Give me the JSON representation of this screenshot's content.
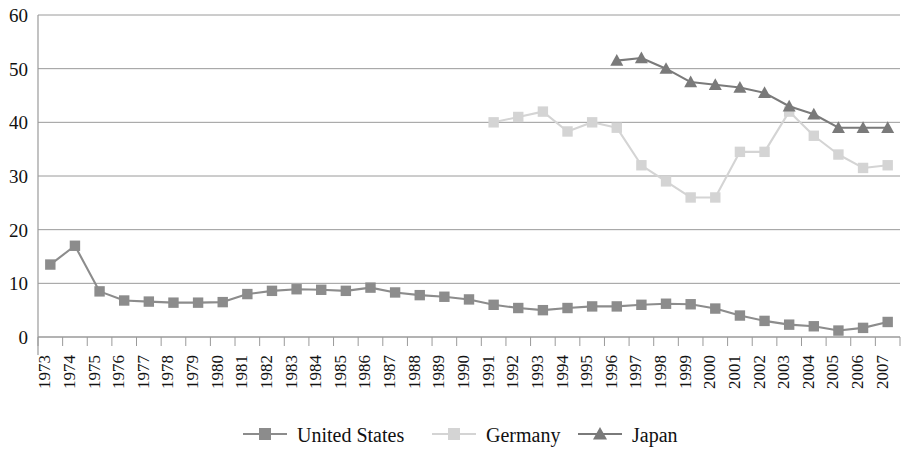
{
  "chart_data": {
    "type": "line",
    "title": "",
    "subtitle": "",
    "xlabel": "",
    "ylabel": "",
    "ylim": [
      0,
      60
    ],
    "ytick_values": [
      0,
      10,
      20,
      30,
      40,
      50,
      60
    ],
    "ytick_labels": [
      "0",
      "10",
      "20",
      "30",
      "40",
      "50",
      "60"
    ],
    "grid": true,
    "grid_axis": "y",
    "legend_position": "bottom",
    "x": [
      "1973",
      "1974",
      "1975",
      "1976",
      "1977",
      "1978",
      "1979",
      "1980",
      "1981",
      "1982",
      "1983",
      "1984",
      "1985",
      "1986",
      "1987",
      "1988",
      "1989",
      "1990",
      "1991",
      "1992",
      "1993",
      "1994",
      "1995",
      "1996",
      "1997",
      "1998",
      "1999",
      "2000",
      "2001",
      "2002",
      "2003",
      "2004",
      "2005",
      "2006",
      "2007"
    ],
    "categories": [
      "1973",
      "1974",
      "1975",
      "1976",
      "1977",
      "1978",
      "1979",
      "1980",
      "1981",
      "1982",
      "1983",
      "1984",
      "1985",
      "1986",
      "1987",
      "1988",
      "1989",
      "1990",
      "1991",
      "1992",
      "1993",
      "1994",
      "1995",
      "1996",
      "1997",
      "1998",
      "1999",
      "2000",
      "2001",
      "2002",
      "2003",
      "2004",
      "2005",
      "2006",
      "2007"
    ],
    "series": [
      {
        "name": "United States",
        "color": "#8c8c8c",
        "marker": "square",
        "values": [
          13.5,
          17.0,
          8.5,
          6.8,
          6.6,
          6.4,
          6.4,
          6.5,
          8.0,
          8.6,
          8.9,
          8.8,
          8.6,
          9.2,
          8.3,
          7.8,
          7.5,
          7.0,
          6.0,
          5.4,
          5.0,
          5.4,
          5.7,
          5.7,
          6.0,
          6.2,
          6.1,
          5.3,
          4.0,
          3.0,
          2.3,
          2.0,
          1.2,
          1.7,
          2.8
        ]
      },
      {
        "name": "Germany",
        "color": "#d4d4d4",
        "marker": "square",
        "values": [
          null,
          null,
          null,
          null,
          null,
          null,
          null,
          null,
          null,
          null,
          null,
          null,
          null,
          null,
          null,
          null,
          null,
          null,
          40.0,
          41.0,
          42.0,
          38.3,
          40.0,
          39.0,
          32.0,
          29.0,
          26.0,
          26.0,
          34.5,
          34.5,
          42.0,
          37.5,
          34.0,
          31.5,
          32.0
        ]
      },
      {
        "name": "Japan",
        "color": "#7a7a7a",
        "marker": "triangle",
        "values": [
          null,
          null,
          null,
          null,
          null,
          null,
          null,
          null,
          null,
          null,
          null,
          null,
          null,
          null,
          null,
          null,
          null,
          null,
          null,
          null,
          null,
          null,
          null,
          51.5,
          52.0,
          50.0,
          47.5,
          47.0,
          46.5,
          45.5,
          43.0,
          41.5,
          39.0,
          39.0,
          39.0
        ]
      }
    ]
  },
  "legend": {
    "items": [
      {
        "label": "United States",
        "color": "#8c8c8c",
        "marker": "square"
      },
      {
        "label": "Germany",
        "color": "#d4d4d4",
        "marker": "square"
      },
      {
        "label": "Japan",
        "color": "#7a7a7a",
        "marker": "triangle"
      }
    ]
  },
  "axes": {
    "y_axis_color": "#9a9a9a",
    "x_axis_color": "#9a9a9a",
    "grid_color": "#9a9a9a"
  }
}
